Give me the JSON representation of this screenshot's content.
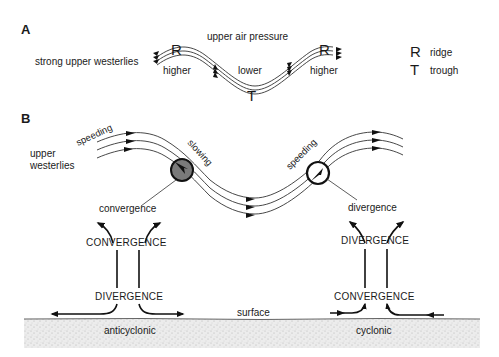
{
  "panel_a": {
    "label": "A",
    "title": "upper air pressure",
    "left_caption": "strong upper westerlies",
    "ridge_left": "R",
    "ridge_right": "R",
    "trough": "T",
    "higher_left": "higher",
    "lower": "lower",
    "higher_right": "higher",
    "legend": [
      {
        "symbol": "R",
        "meaning": "ridge"
      },
      {
        "symbol": "T",
        "meaning": "trough"
      }
    ]
  },
  "panel_b": {
    "label": "B",
    "upper_caption_line1": "upper",
    "upper_caption_line2": "westerlies",
    "speeding_left": "speeding",
    "slowing": "slowing",
    "speeding_right": "speeding",
    "left_column": {
      "upper_label": "convergence",
      "top_caps": "CONVERGENCE",
      "bottom_caps": "DIVERGENCE",
      "surface_type": "anticyclonic"
    },
    "right_column": {
      "upper_label": "divergence",
      "top_caps": "DIVERGENCE",
      "bottom_caps": "CONVERGENCE",
      "surface_type": "cyclonic"
    },
    "surface": "surface"
  },
  "colors": {
    "ink": "#1a1a1a",
    "ground_fill": "#e6e6e6",
    "slowing_circle_fill": "#7a7a7a"
  }
}
